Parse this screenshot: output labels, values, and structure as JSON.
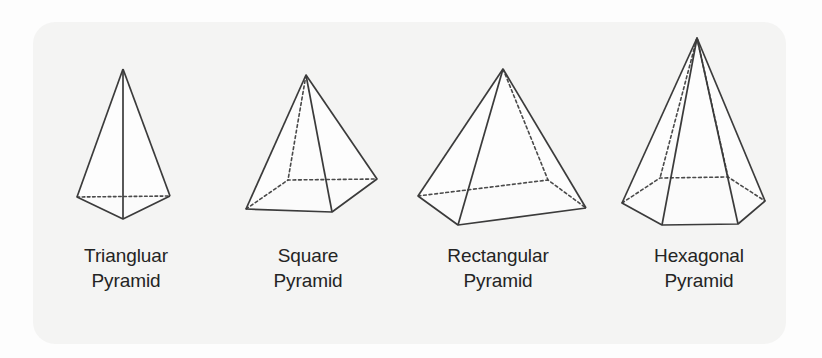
{
  "figure": {
    "card": {
      "background_color": "#f4f4f3",
      "corner_radius": 22
    },
    "style": {
      "edge_color": "#3b3b3b",
      "base_fill_color": "#bdbdbd",
      "face_fill_color": "#fdfdfd",
      "hidden_edge_style": "dotted"
    },
    "shapes": [
      {
        "id": "triangular-pyramid",
        "label_line1": "Triangluar",
        "label_line2": "Pyramid",
        "base_sides": 3,
        "apex": [
          123,
          69
        ],
        "base_vertices": [
          [
            77,
            197
          ],
          [
            170,
            196
          ],
          [
            123,
            219
          ]
        ],
        "hidden_base_edges": [
          [
            0,
            1
          ]
        ],
        "hidden_lateral_vertices": []
      },
      {
        "id": "square-pyramid",
        "label_line1": "Square",
        "label_line2": "Pyramid",
        "base_sides": 4,
        "apex": [
          306,
          75
        ],
        "base_vertices": [
          [
            246,
            209
          ],
          [
            288,
            180
          ],
          [
            377,
            179
          ],
          [
            332,
            212
          ]
        ],
        "hidden_base_edges": [
          [
            0,
            1
          ],
          [
            1,
            2
          ]
        ],
        "hidden_lateral_vertices": [
          1
        ]
      },
      {
        "id": "rectangular-pyramid",
        "label_line1": "Rectangular",
        "label_line2": "Pyramid",
        "base_sides": 4,
        "apex": [
          503,
          69
        ],
        "base_vertices": [
          [
            418,
            196
          ],
          [
            548,
            180
          ],
          [
            586,
            208
          ],
          [
            458,
            225
          ]
        ],
        "hidden_base_edges": [
          [
            0,
            1
          ],
          [
            1,
            2
          ]
        ],
        "hidden_lateral_vertices": [
          1
        ]
      },
      {
        "id": "hexagonal-pyramid",
        "label_line1": "Hexagonal",
        "label_line2": "Pyramid",
        "base_sides": 6,
        "apex": [
          697,
          38
        ],
        "base_vertices": [
          [
            622,
            203
          ],
          [
            660,
            178
          ],
          [
            728,
            177
          ],
          [
            765,
            201
          ],
          [
            738,
            224
          ],
          [
            662,
            225
          ]
        ],
        "hidden_base_edges": [
          [
            0,
            1
          ],
          [
            1,
            2
          ],
          [
            2,
            3
          ]
        ],
        "hidden_lateral_vertices": [
          1,
          2
        ]
      }
    ]
  }
}
